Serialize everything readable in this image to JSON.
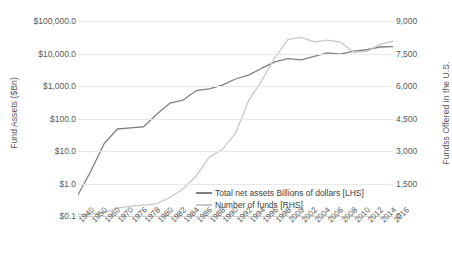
{
  "chart_data": {
    "type": "line",
    "title": "",
    "xlabel": "",
    "grid": true,
    "legend_position": "inside-bottom-center",
    "axes": {
      "left": {
        "label": "Fund Assets ($Bn)",
        "scale": "log",
        "ticks": [
          "$0.1",
          "$1.0",
          "$10.0",
          "$100.0",
          "$1,000.0",
          "$10,000.0",
          "$100,000.0"
        ],
        "tick_values": [
          0.1,
          1,
          10,
          100,
          1000,
          10000,
          100000
        ],
        "ylim": [
          0.1,
          100000
        ]
      },
      "right": {
        "label": "Fundss Offered in the U.S.",
        "scale": "linear",
        "ticks": [
          "0",
          "1,500",
          "3,000",
          "4,500",
          "6,000",
          "7,500",
          "9,000"
        ],
        "tick_values": [
          0,
          1500,
          3000,
          4500,
          6000,
          7500,
          9000
        ],
        "ylim": [
          0,
          9000
        ]
      }
    },
    "categories": [
      "1940",
      "1950",
      "1960",
      "1970",
      "1976",
      "1978",
      "1980",
      "1982",
      "1984",
      "1986",
      "1988",
      "1990",
      "1992",
      "1994",
      "1996",
      "1998",
      "2000",
      "2002",
      "2004",
      "2006",
      "2008",
      "2010",
      "2012",
      "2014",
      "2016"
    ],
    "series": [
      {
        "name": "Total net assets Billions of dollars [LHS]",
        "axis": "left",
        "color": "#808080",
        "values": [
          0.45,
          2.5,
          17.0,
          47.6,
          51.3,
          55.8,
          134.8,
          296.7,
          370.7,
          716.2,
          810.3,
          1065.2,
          1642.5,
          2155.3,
          3525.8,
          5525.2,
          6964.6,
          6390.4,
          8106.9,
          10413.6,
          9604.0,
          11820.7,
          13045.2,
          15852.3,
          16344.2
        ]
      },
      {
        "name": "Number of funds [RHS]",
        "axis": "right",
        "color": "#c8c8c8",
        "values": [
          68,
          98,
          161,
          361,
          452,
          505,
          564,
          857,
          1243,
          1835,
          2715,
          3079,
          3824,
          5330,
          6248,
          7314,
          8155,
          8244,
          8041,
          8117,
          8022,
          7554,
          7587,
          7920,
          8066
        ]
      }
    ]
  },
  "legend": {
    "items": [
      {
        "label": "Total net assets Billions of dollars [LHS]",
        "color": "#808080"
      },
      {
        "label": "Number of funds [RHS]",
        "color": "#c8c8c8"
      }
    ]
  }
}
